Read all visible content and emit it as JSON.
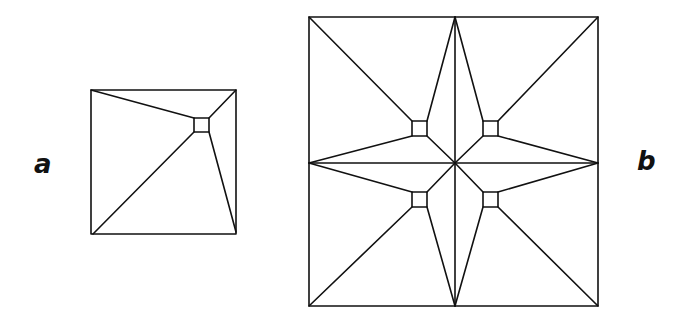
{
  "figure_a": {
    "label": "a",
    "outer": {
      "x1": 91,
      "y1": 90,
      "x2": 236,
      "y2": 234
    },
    "inner_square": {
      "x": 194,
      "y": 118,
      "w": 15,
      "h": 14
    }
  },
  "figure_b": {
    "label": "b",
    "outer": {
      "x1": 309,
      "y1": 17,
      "x2": 598,
      "y2": 306
    },
    "center": {
      "x": 455,
      "y": 163
    },
    "inner_squares": [
      {
        "x": 412,
        "y": 121,
        "w": 15,
        "h": 15
      },
      {
        "x": 483,
        "y": 121,
        "w": 15,
        "h": 15
      },
      {
        "x": 412,
        "y": 192,
        "w": 15,
        "h": 15
      },
      {
        "x": 483,
        "y": 192,
        "w": 15,
        "h": 15
      }
    ]
  },
  "colors": {
    "line": "#111111",
    "background": "#ffffff"
  }
}
